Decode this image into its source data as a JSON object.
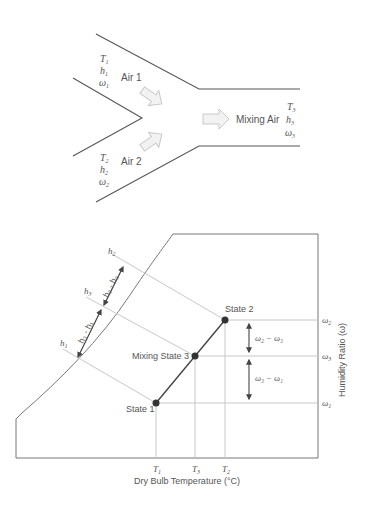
{
  "mixing_duct": {
    "inlet1": {
      "label": "Air 1",
      "vars": [
        "T",
        "h",
        "ω"
      ],
      "sub": "1"
    },
    "inlet2": {
      "label": "Air 2",
      "vars": [
        "T",
        "h",
        "ω"
      ],
      "sub": "2"
    },
    "outlet": {
      "label": "Mixing Air",
      "vars": [
        "T",
        "h",
        "ω"
      ],
      "sub": "3"
    }
  },
  "chart": {
    "xlabel": "Dry Bulb Temperature (°C)",
    "ylabel": "Humidity Ratio (ω)",
    "states": {
      "s1": "State 1",
      "s2": "State 2",
      "s3": "Mixing  State 3"
    },
    "x_ticks": {
      "t1": "1",
      "t3": "3",
      "t2": "2",
      "var": "T"
    },
    "y_ticks": {
      "w2": "2",
      "w3": "3",
      "w1": "1",
      "var": "ω"
    },
    "enthalpy_ticks": {
      "h2": "2",
      "h3": "3",
      "h1": "1",
      "var": "h"
    },
    "diff_labels": {
      "w2_w3": "ω₂ − ω₃",
      "w3_w1": "ω₃ − ω₁",
      "h2_h3": "h₂ - h₃",
      "h3_h1": "h₃ - h₁"
    }
  },
  "colors": {
    "line": "#555555",
    "guide": "#c8c8c8",
    "arrow_fill": "#f2f2f2",
    "arrow_stroke": "#c8c8c8",
    "point": "#333333"
  }
}
